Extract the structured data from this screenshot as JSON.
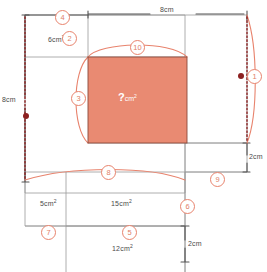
{
  "figure": {
    "colors": {
      "accent": "#e8836d",
      "fill": "#e8836d",
      "fill_solid": "#e98a72",
      "line_gray": "#9a9a9a",
      "line_dark": "#555555",
      "dot": "#8c2020",
      "marker_text": "#e08068",
      "question_text": "#ffffff",
      "label_text": "#4a4a4a",
      "background": "#ffffff"
    }
  },
  "dimension_labels": [
    {
      "id": "top-width",
      "text": "8cm",
      "value": 8,
      "unit": "cm",
      "orientation": "horizontal"
    },
    {
      "id": "left-height",
      "text": "8cm",
      "value": 8,
      "unit": "cm",
      "orientation": "vertical"
    },
    {
      "id": "right-gap",
      "text": "2cm",
      "value": 2,
      "unit": "cm",
      "orientation": "vertical"
    },
    {
      "id": "bottom-gap",
      "text": "2cm",
      "value": 2,
      "unit": "cm",
      "orientation": "vertical"
    }
  ],
  "area_labels": [
    {
      "id": "area-6",
      "text": "6cm",
      "value": 6,
      "unit": "cm2",
      "sup": "2"
    },
    {
      "id": "area-5",
      "text": "5cm",
      "value": 5,
      "unit": "cm2",
      "sup": "2"
    },
    {
      "id": "area-15",
      "text": "15cm",
      "value": 15,
      "unit": "cm2",
      "sup": "2"
    },
    {
      "id": "area-12",
      "text": "12cm",
      "value": 12,
      "unit": "cm2",
      "sup": "2"
    }
  ],
  "unknown_area": {
    "symbol": "?",
    "unit": "cm",
    "sup": "2"
  },
  "markers": [
    {
      "n": "1",
      "x": 247,
      "y": 69
    },
    {
      "n": "2",
      "x": 62,
      "y": 31
    },
    {
      "n": "3",
      "x": 71,
      "y": 91
    },
    {
      "n": "4",
      "x": 55,
      "y": 10
    },
    {
      "n": "5",
      "x": 122,
      "y": 225
    },
    {
      "n": "6",
      "x": 180,
      "y": 199
    },
    {
      "n": "7",
      "x": 41,
      "y": 225
    },
    {
      "n": "8",
      "x": 101,
      "y": 165
    },
    {
      "n": "9",
      "x": 210,
      "y": 172
    },
    {
      "n": "10",
      "x": 130,
      "y": 40
    }
  ],
  "endpoint_dots": [
    {
      "id": "dot-right",
      "x": 238,
      "y": 73
    },
    {
      "id": "dot-left",
      "x": 23,
      "y": 113
    }
  ]
}
